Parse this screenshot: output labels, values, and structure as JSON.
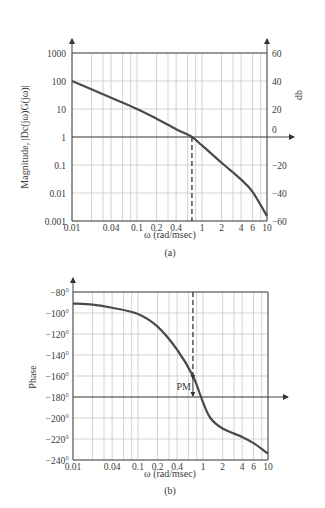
{
  "chart_data": [
    {
      "type": "line",
      "panel": "(a)",
      "title": "",
      "xlabel": "ω (rad/msec)",
      "ylabel": "Magnitude, |Dc(jω)G(jω)|",
      "ylabel_right": "db",
      "xscale": "log",
      "yscale": "log",
      "xlim": [
        0.01,
        10
      ],
      "ylim": [
        0.001,
        1000
      ],
      "grid": true,
      "x_ticks": [
        "0.01",
        "0.04",
        "0.1",
        "0.2",
        "0.4",
        "1",
        "2",
        "4",
        "6",
        "10"
      ],
      "y_ticks_left": [
        "1000",
        "100",
        "10",
        "1",
        "0.1",
        "0.01",
        "0.001"
      ],
      "y_ticks_right": [
        "60",
        "40",
        "20",
        "0",
        "−20",
        "−40",
        "−60"
      ],
      "x": [
        0.01,
        0.04,
        0.1,
        0.2,
        0.4,
        0.7,
        1,
        2,
        4,
        6,
        10
      ],
      "series": [
        {
          "name": "Magnitude",
          "values": [
            100,
            25,
            10,
            4.5,
            1.9,
            1.0,
            0.5,
            0.12,
            0.03,
            0.011,
            0.0015
          ]
        }
      ],
      "annotations": [
        {
          "type": "dashed-vertical",
          "x": 0.7,
          "from": 1,
          "to": 0.001,
          "label": "crossover frequency"
        }
      ]
    },
    {
      "type": "line",
      "panel": "(b)",
      "title": "",
      "xlabel": "ω (rad/msec)",
      "ylabel": "Phase",
      "xscale": "log",
      "xlim": [
        0.01,
        10
      ],
      "ylim": [
        -240,
        -80
      ],
      "grid": true,
      "x_ticks": [
        "0.01",
        "0.04",
        "0.1",
        "0.2",
        "0.4",
        "1",
        "2",
        "4",
        "6",
        "10"
      ],
      "y_ticks": [
        "−80°",
        "−100°",
        "−120°",
        "−140°",
        "−160°",
        "−180°",
        "−200°",
        "−220°",
        "−240°"
      ],
      "x": [
        0.01,
        0.02,
        0.04,
        0.1,
        0.2,
        0.4,
        0.7,
        1,
        1.3,
        2,
        4,
        6,
        10
      ],
      "series": [
        {
          "name": "Phase",
          "values": [
            -91,
            -92,
            -95,
            -101,
            -113,
            -135,
            -160,
            -185,
            -200,
            -210,
            -218,
            -224,
            -234
          ]
        }
      ],
      "annotations": [
        {
          "type": "dashed-vertical",
          "x": 0.7,
          "from": -80,
          "to": -160
        },
        {
          "type": "double-arrow",
          "x": 0.7,
          "from": -160,
          "to": -180,
          "label": "PM"
        }
      ]
    }
  ],
  "figure": {
    "panel_a_caption": "(a)",
    "panel_b_caption": "(b)",
    "pm_label": "PM"
  }
}
